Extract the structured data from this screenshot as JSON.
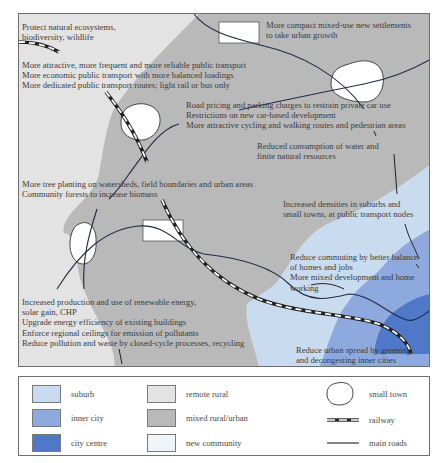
{
  "colors": {
    "suburb": "#c9dbef",
    "inner_city": "#8ea9de",
    "city_centre": "#4f78c9",
    "remote_rural": "#e3e3e3",
    "mixed_rural_urban": "#b8b8b8",
    "new_community": "#eef4f8",
    "road": "#1f2a44",
    "border": "#6f6f6f"
  },
  "map": {
    "annotations": {
      "ecosystems": [
        "Protect natural ecosystems,",
        "biodiversity, wildlife"
      ],
      "settlements": [
        "More compact mixed-use new settlements",
        "to take urban growth"
      ],
      "transport": [
        "More attractive, more frequent and more reliable public transport",
        "More economic public transport with more balanced loadings",
        "More dedicated public transport routes; light rail or bus only"
      ],
      "road_pricing": [
        "Road pricing and parking charges to restrain private car use",
        "Restrictions on new car-based development",
        "More attractive cycling and walking routes and pedestrian areas"
      ],
      "water": [
        "Reduced consumption of water and",
        "finite natural resources"
      ],
      "trees": [
        "More tree planting on watersheds, field boundaries and urban areas",
        "Community forests to increase biomass"
      ],
      "densities": [
        "Increased densities in suburbs and",
        "small towns, at public transport nodes"
      ],
      "commuting": [
        "Reduce commuting by better balance",
        "of homes and jobs",
        "More mixed development and home",
        "working"
      ],
      "energy": [
        "Increased production and use of renewable energy,",
        "solar gain, CHP",
        "Upgrade energy efficiency of existing buildings",
        "Enforce regional ceilings for emission of pollutants",
        "Reduce pollution and waste by closed-cycle processes, recycling"
      ],
      "urban_spread": [
        "Reduce urban spread by greening",
        "and decongesting inner cities"
      ]
    }
  },
  "legend": {
    "zones": [
      {
        "label": "suburb",
        "color_key": "suburb"
      },
      {
        "label": "inner city",
        "color_key": "inner_city"
      },
      {
        "label": "city centre",
        "color_key": "city_centre"
      },
      {
        "label": "remote rural",
        "color_key": "remote_rural"
      },
      {
        "label": "mixed rural/urban",
        "color_key": "mixed_rural_urban"
      },
      {
        "label": "new community",
        "color_key": "new_community"
      }
    ],
    "symbols": [
      {
        "label": "small town",
        "icon": "small-town-icon"
      },
      {
        "label": "railway",
        "icon": "railway-icon"
      },
      {
        "label": "main roads",
        "icon": "main-road-icon"
      }
    ]
  }
}
